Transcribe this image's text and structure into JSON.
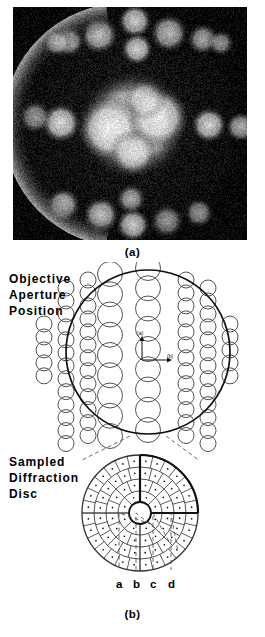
{
  "figure": {
    "panels": [
      {
        "id": "a",
        "caption": "(a)",
        "kind": "photograph",
        "description": "convergent-beam electron diffraction pattern photograph"
      },
      {
        "id": "b",
        "caption": "(b)",
        "kind": "schematic"
      }
    ]
  },
  "panel_a": {
    "caption": "(a)",
    "background_color": "#050505",
    "spot_color": "#e8e8e8"
  },
  "panel_b": {
    "caption": "(b)",
    "objective_label": {
      "name": "objective-aperture-position",
      "lines": [
        "Objective",
        "Aperture",
        "Position"
      ]
    },
    "sampled_label": {
      "name": "sampled-diffraction-disc",
      "lines": [
        "Sampled",
        "Diffraction",
        "Disc"
      ]
    },
    "ring_labels": [
      "a",
      "b",
      "c",
      "d"
    ],
    "inner_markers": [
      "(a)",
      "(b)"
    ],
    "stroke_color": "#111111",
    "thin_stroke": "#333333"
  },
  "chart_data": {
    "type": "diagram",
    "aperture_map": {
      "name": "objective-aperture-position",
      "outer_circle": {
        "cx": 148,
        "cy": 90,
        "r": 82
      },
      "columns": [
        {
          "x": 44,
          "r": 8.0,
          "count": 5,
          "y0": 62
        },
        {
          "x": 66,
          "r": 8.0,
          "count": 15,
          "y0": 26
        },
        {
          "x": 88,
          "r": 8.0,
          "count": 17,
          "y0": 18
        },
        {
          "x": 110,
          "r": 12.5,
          "count": 11,
          "y0": 12
        },
        {
          "x": 148,
          "r": 12.5,
          "count": 12,
          "y0": 6
        },
        {
          "x": 186,
          "r": 8.0,
          "count": 17,
          "y0": 18
        },
        {
          "x": 208,
          "r": 8.0,
          "count": 15,
          "y0": 26
        },
        {
          "x": 230,
          "r": 8.0,
          "count": 5,
          "y0": 62
        }
      ]
    },
    "sampled_disc": {
      "name": "sampled-diffraction-disc",
      "center": {
        "cx": 140,
        "cy": 251
      },
      "hub_radius": 11,
      "ring_radii": [
        11,
        22,
        34,
        46,
        58
      ],
      "sector_counts": [
        8,
        16,
        24,
        28
      ],
      "highlight_quadrant": "upper-right",
      "callouts": [
        {
          "label": "a",
          "radius": 16,
          "x": 119
        },
        {
          "label": "b",
          "radius": 28,
          "x": 136
        },
        {
          "label": "c",
          "radius": 40,
          "x": 153
        },
        {
          "label": "d",
          "radius": 52,
          "x": 171
        }
      ]
    }
  }
}
